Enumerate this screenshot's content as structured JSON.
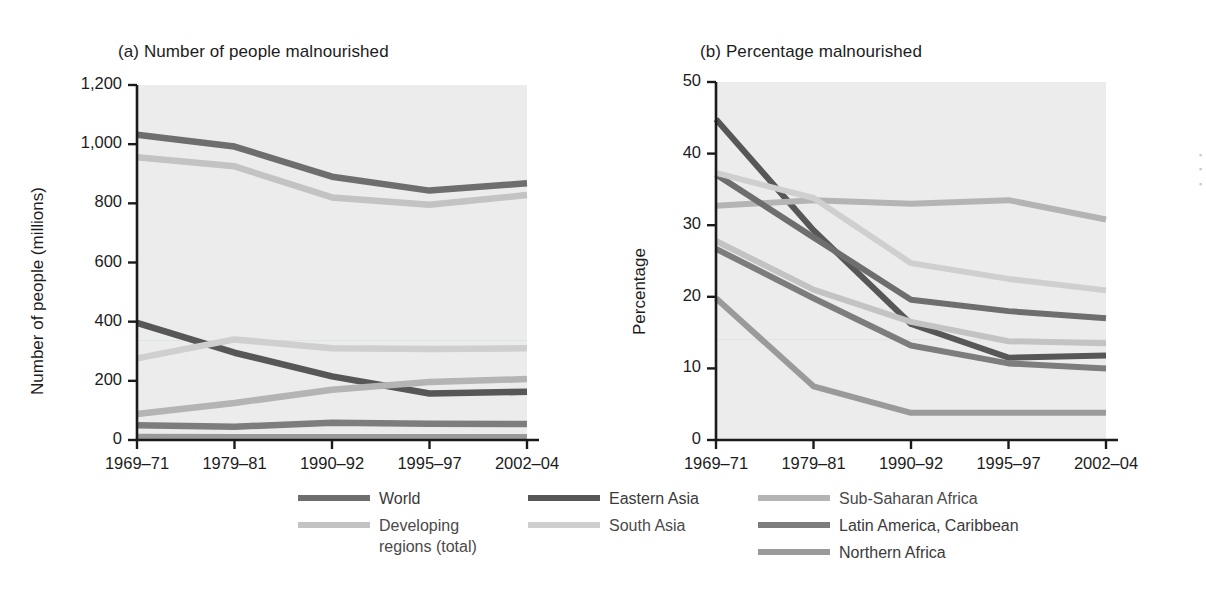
{
  "figure": {
    "background": "#ffffff",
    "plot_background": "#ececec"
  },
  "panel_a": {
    "title": "(a) Number of people malnourished",
    "ylabel": "Number of people (millions)",
    "ytick_labels": [
      "1,200",
      "1,000",
      "800",
      "600",
      "400",
      "200",
      "0"
    ],
    "xtick_labels": [
      "1969–71",
      "1979–81",
      "1990–92",
      "1995–97",
      "2002–04"
    ]
  },
  "panel_b": {
    "title": "(b) Percentage malnourished",
    "ylabel": "Percentage",
    "ytick_labels": [
      "50",
      "40",
      "30",
      "20",
      "10",
      "0"
    ],
    "xtick_labels": [
      "1969–71",
      "1979–81",
      "1990–92",
      "1995–97",
      "2002–04"
    ]
  },
  "legend": {
    "columns": [
      [
        {
          "label": "World",
          "color": "#6e6e6e",
          "tone": "dark"
        },
        {
          "label": "Developing\nregions (total)",
          "color": "#c3c3c3",
          "tone": "light"
        }
      ],
      [
        {
          "label": "Eastern Asia",
          "color": "#575757",
          "tone": "dark"
        },
        {
          "label": "South Asia",
          "color": "#cfcfcf",
          "tone": "light"
        }
      ],
      [
        {
          "label": "Sub-Saharan Africa",
          "color": "#b4b4b4",
          "tone": "light"
        },
        {
          "label": "Latin America, Caribbean",
          "color": "#7d7d7d",
          "tone": "dark"
        },
        {
          "label": "Northern Africa",
          "color": "#9a9a9a",
          "tone": "dark"
        }
      ]
    ]
  },
  "chart_data": [
    {
      "type": "line",
      "title": "(a) Number of people malnourished",
      "xlabel": "",
      "ylabel": "Number of people (millions)",
      "categories": [
        "1969–71",
        "1979–81",
        "1990–92",
        "1995–97",
        "2002–04"
      ],
      "ylim": [
        0,
        1200
      ],
      "ytick_step": 200,
      "grid": false,
      "legend_position": "bottom",
      "series": [
        {
          "name": "World",
          "color": "#6e6e6e",
          "values": [
            1032,
            992,
            890,
            843,
            868
          ]
        },
        {
          "name": "Developing regions (total)",
          "color": "#c3c3c3",
          "values": [
            956,
            925,
            820,
            795,
            828
          ]
        },
        {
          "name": "Eastern Asia",
          "color": "#575757",
          "values": [
            396,
            295,
            215,
            157,
            163
          ]
        },
        {
          "name": "South Asia",
          "color": "#cfcfcf",
          "values": [
            276,
            340,
            310,
            308,
            310
          ]
        },
        {
          "name": "Sub-Saharan Africa",
          "color": "#b4b4b4",
          "values": [
            88,
            125,
            170,
            196,
            206
          ]
        },
        {
          "name": "Latin America, Caribbean",
          "color": "#7d7d7d",
          "values": [
            50,
            45,
            58,
            55,
            54
          ]
        },
        {
          "name": "Northern Africa",
          "color": "#9a9a9a",
          "values": [
            10,
            9,
            9,
            9,
            9
          ]
        }
      ]
    },
    {
      "type": "line",
      "title": "(b) Percentage malnourished",
      "xlabel": "",
      "ylabel": "Percentage",
      "categories": [
        "1969–71",
        "1979–81",
        "1990–92",
        "1995–97",
        "2002–04"
      ],
      "ylim": [
        0,
        50
      ],
      "ytick_step": 10,
      "grid": false,
      "legend_position": "bottom",
      "series": [
        {
          "name": "Eastern Asia",
          "color": "#575757",
          "values": [
            44.8,
            29.3,
            16.2,
            11.5,
            11.8
          ]
        },
        {
          "name": "Sub-Saharan Africa",
          "color": "#b4b4b4",
          "values": [
            32.7,
            33.5,
            33.0,
            33.5,
            30.8
          ]
        },
        {
          "name": "World",
          "color": "#6e6e6e",
          "values": [
            37.1,
            28.3,
            19.6,
            18.0,
            17.0
          ]
        },
        {
          "name": "South Asia",
          "color": "#cfcfcf",
          "values": [
            37.3,
            33.8,
            24.7,
            22.5,
            20.9
          ]
        },
        {
          "name": "Developing regions (total)",
          "color": "#c3c3c3",
          "values": [
            27.8,
            21.0,
            16.5,
            13.8,
            13.5
          ]
        },
        {
          "name": "Latin America, Caribbean",
          "color": "#7d7d7d",
          "values": [
            26.7,
            19.8,
            13.2,
            10.7,
            10.0
          ]
        },
        {
          "name": "Northern Africa",
          "color": "#9a9a9a",
          "values": [
            19.8,
            7.5,
            3.8,
            3.8,
            3.8
          ]
        }
      ]
    }
  ]
}
